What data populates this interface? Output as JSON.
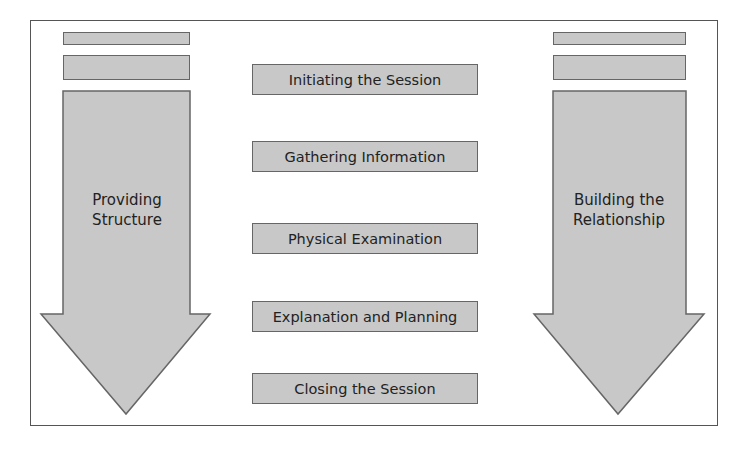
{
  "diagram": {
    "left_arrow": {
      "label_line1": "Providing",
      "label_line2": "Structure"
    },
    "right_arrow": {
      "label_line1": "Building the",
      "label_line2": "Relationship"
    },
    "stages": [
      {
        "label": "Initiating the Session"
      },
      {
        "label": "Gathering Information"
      },
      {
        "label": "Physical Examination"
      },
      {
        "label": "Explanation and Planning"
      },
      {
        "label": "Closing the Session"
      }
    ],
    "colors": {
      "fill": "#c8c8c8",
      "stroke": "#666666",
      "frame": "#555555",
      "text": "#222222"
    }
  }
}
